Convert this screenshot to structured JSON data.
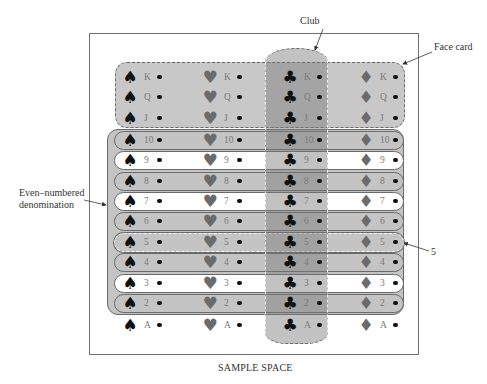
{
  "caption": "SAMPLE SPACE",
  "annotations": {
    "club": "Club",
    "face_card": "Face card",
    "even": [
      "Even–numbered",
      "denomination"
    ],
    "five": "5"
  },
  "suits": [
    {
      "name": "spade",
      "glyph": "♠",
      "color": "#111111"
    },
    {
      "name": "heart",
      "glyph": "♥",
      "color": "#6b6b6b"
    },
    {
      "name": "club",
      "glyph": "♣",
      "color": "#111111"
    },
    {
      "name": "diamond",
      "glyph": "♦",
      "color": "#6b6b6b"
    }
  ],
  "ranks": [
    "K",
    "Q",
    "J",
    "10",
    "9",
    "8",
    "7",
    "6",
    "5",
    "4",
    "3",
    "2",
    "A"
  ],
  "events": {
    "face_card": [
      "K",
      "Q",
      "J"
    ],
    "even_numbered": [
      "10",
      "8",
      "6",
      "4",
      "2"
    ],
    "club": "all clubs",
    "five": [
      "5"
    ]
  },
  "colors": {
    "shade_light": "#c4c4c4",
    "shade_club": "#8a8a8a",
    "frame": "#6f6f6f"
  }
}
